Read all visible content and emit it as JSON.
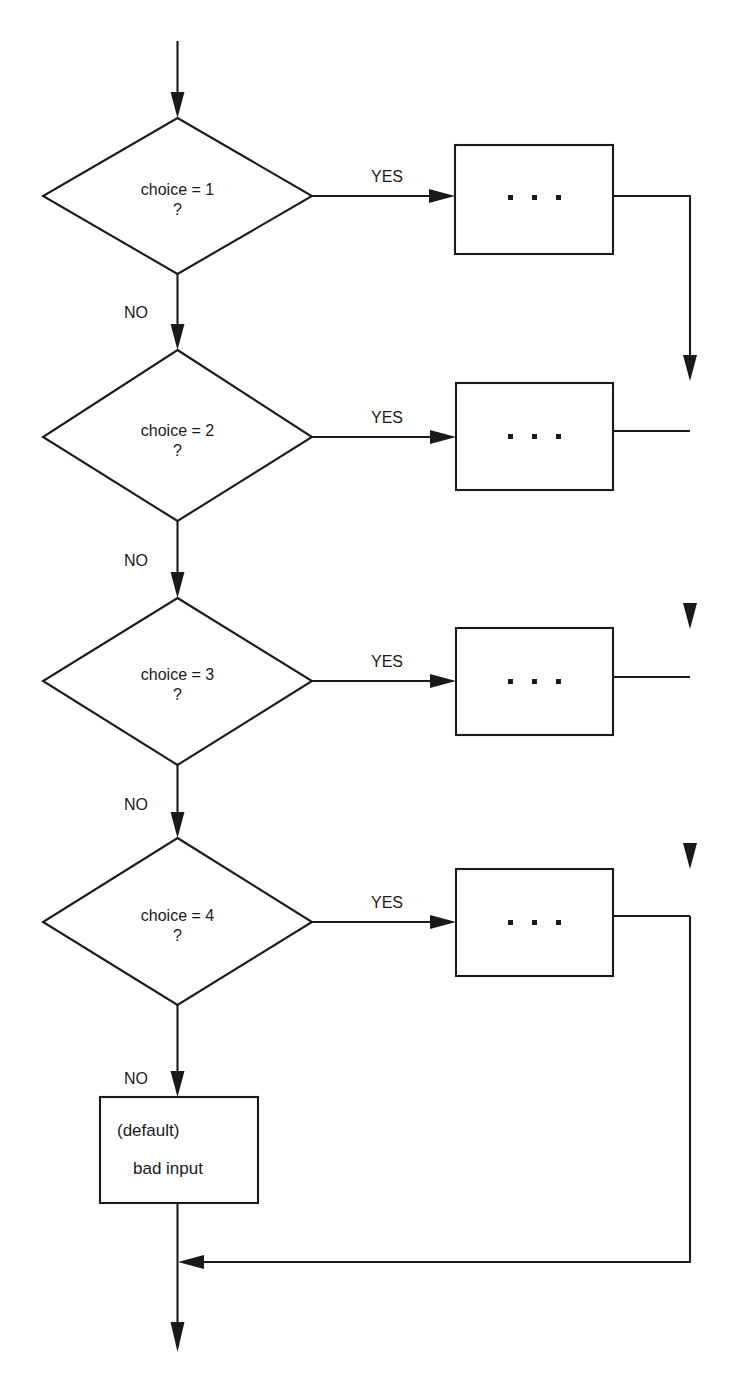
{
  "diagram": {
    "stroke_color": "#1a1a1a",
    "background_color": "#ffffff",
    "entry_label": "",
    "exit_label": ""
  },
  "decisions": [
    {
      "id": "d1",
      "line1": "choice = 1",
      "line2": "?",
      "yes_label": "YES",
      "no_label": "NO"
    },
    {
      "id": "d2",
      "line1": "choice = 2",
      "line2": "?",
      "yes_label": "YES",
      "no_label": "NO"
    },
    {
      "id": "d3",
      "line1": "choice = 3",
      "line2": "?",
      "yes_label": "YES",
      "no_label": "NO"
    },
    {
      "id": "d4",
      "line1": "choice = 4",
      "line2": "?",
      "yes_label": "YES",
      "no_label": "NO"
    }
  ],
  "process_boxes": [
    {
      "id": "p1",
      "content": "...",
      "glyph": "three-dots"
    },
    {
      "id": "p2",
      "content": "...",
      "glyph": "three-dots"
    },
    {
      "id": "p3",
      "content": "...",
      "glyph": "three-dots"
    },
    {
      "id": "p4",
      "content": "...",
      "glyph": "three-dots"
    }
  ],
  "default_box": {
    "id": "dflt",
    "line1": "(default)",
    "line2": "bad input"
  }
}
